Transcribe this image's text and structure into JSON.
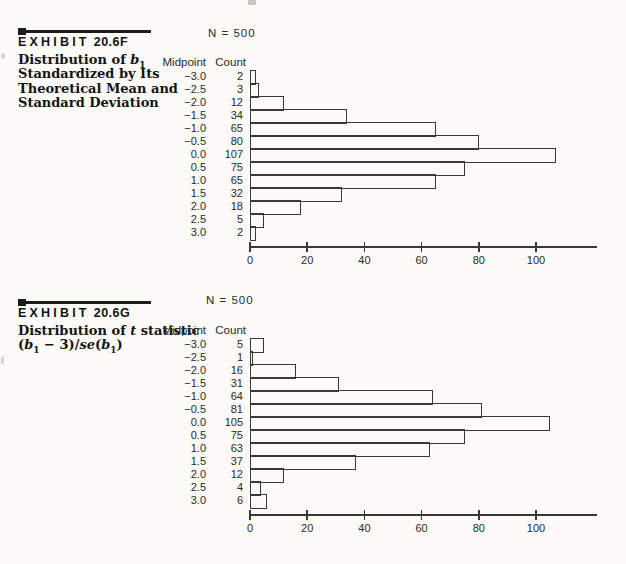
{
  "page": {
    "background": "#fbfaf7",
    "ink_color": "#383838"
  },
  "exhibits": [
    {
      "heading_word": "EXHIBIT",
      "heading_number": "20.6F",
      "description_lines": [
        [
          {
            "t": "Distribution of "
          },
          {
            "t": "b",
            "i": true
          },
          {
            "t": "1",
            "sub": true
          }
        ],
        "Standardized by Its",
        "Theoretical Mean and",
        "Standard Deviation"
      ]
    },
    {
      "heading_word": "EXHIBIT",
      "heading_number": "20.6G",
      "description_lines": [
        [
          {
            "t": "Distribution of "
          },
          {
            "t": "t",
            "i": true
          },
          {
            "t": " statistic"
          }
        ],
        [
          {
            "t": "("
          },
          {
            "t": "b",
            "i": true
          },
          {
            "t": "1",
            "sub": true
          },
          {
            "t": " − 3)/"
          },
          {
            "t": "se",
            "i": true
          },
          {
            "t": "("
          },
          {
            "t": "b",
            "i": true
          },
          {
            "t": "1",
            "sub": true
          },
          {
            "t": ")"
          }
        ]
      ]
    }
  ],
  "chart_data": [
    {
      "type": "bar",
      "orientation": "horizontal",
      "title": "N = 500",
      "col_headers": [
        "Midpoint",
        "Count"
      ],
      "categories": [
        "−3.0",
        "−2.5",
        "−2.0",
        "−1.5",
        "−1.0",
        "−0.5",
        "0.0",
        "0.5",
        "1.0",
        "1.5",
        "2.0",
        "2.5",
        "3.0"
      ],
      "values": [
        2,
        3,
        12,
        34,
        65,
        80,
        107,
        75,
        65,
        32,
        18,
        5,
        2
      ],
      "xticks": [
        0,
        20,
        40,
        60,
        80,
        100
      ],
      "xlim": [
        0,
        121
      ],
      "grid": false,
      "bar_style": "open-outline"
    },
    {
      "type": "bar",
      "orientation": "horizontal",
      "title": "N = 500",
      "col_headers": [
        "Midpoint",
        "Count"
      ],
      "categories": [
        "−3.0",
        "−2.5",
        "−2.0",
        "−1.5",
        "−1.0",
        "−0.5",
        "0.0",
        "0.5",
        "1.0",
        "1.5",
        "2.0",
        "2.5",
        "3.0"
      ],
      "values": [
        5,
        1,
        16,
        31,
        64,
        81,
        105,
        75,
        63,
        37,
        12,
        4,
        6
      ],
      "xticks": [
        0,
        20,
        40,
        60,
        80,
        100
      ],
      "xlim": [
        0,
        121
      ],
      "grid": false,
      "bar_style": "open-outline"
    }
  ]
}
